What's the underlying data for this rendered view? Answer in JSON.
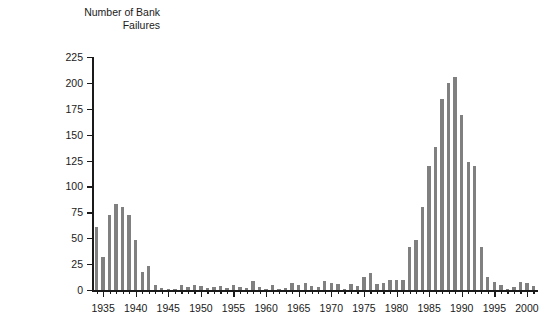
{
  "chart_data": {
    "type": "bar",
    "title": "",
    "ylabel": "Number of Bank\nFailures",
    "xlabel": "",
    "ylim": [
      0,
      225
    ],
    "ytick_values": [
      0,
      25,
      50,
      75,
      100,
      125,
      150,
      175,
      200,
      225
    ],
    "ytick_labels": [
      "0",
      "25",
      "50",
      "75",
      "100",
      "125",
      "150",
      "175",
      "200",
      "225"
    ],
    "xtick_labels": [
      "1935",
      "1940",
      "1945",
      "1950",
      "1955",
      "1960",
      "1965",
      "1970",
      "1975",
      "1980",
      "1985",
      "1990",
      "1995",
      "2000"
    ],
    "xtick_values": [
      1935,
      1940,
      1945,
      1950,
      1955,
      1960,
      1965,
      1970,
      1975,
      1980,
      1985,
      1990,
      1995,
      2000
    ],
    "xlim": [
      1933.3,
      2001.7
    ],
    "grid": false,
    "legend": null,
    "bar_color": "#808080",
    "axis_color": "#1a1a1a",
    "background": "#ffffff",
    "categories": [
      1934,
      1935,
      1936,
      1937,
      1938,
      1939,
      1940,
      1941,
      1942,
      1943,
      1944,
      1945,
      1946,
      1947,
      1948,
      1949,
      1950,
      1951,
      1952,
      1953,
      1954,
      1955,
      1956,
      1957,
      1958,
      1959,
      1960,
      1961,
      1962,
      1963,
      1964,
      1965,
      1966,
      1967,
      1968,
      1969,
      1970,
      1971,
      1972,
      1973,
      1974,
      1975,
      1976,
      1977,
      1978,
      1979,
      1980,
      1981,
      1982,
      1983,
      1984,
      1985,
      1986,
      1987,
      1988,
      1989,
      1990,
      1991,
      1992,
      1993,
      1994,
      1995,
      1996,
      1997,
      1998,
      1999,
      2000,
      2001
    ],
    "values": [
      61,
      32,
      72,
      83,
      80,
      72,
      48,
      17,
      23,
      5,
      2,
      1,
      1,
      5,
      3,
      5,
      4,
      2,
      3,
      4,
      2,
      5,
      3,
      2,
      9,
      3,
      1,
      5,
      1,
      2,
      7,
      5,
      7,
      4,
      3,
      9,
      7,
      6,
      1,
      6,
      4,
      13,
      16,
      6,
      7,
      10,
      10,
      10,
      42,
      48,
      80,
      120,
      138,
      184,
      200,
      206,
      169,
      124,
      120,
      42,
      13,
      8,
      5,
      1,
      3,
      8,
      7,
      4
    ]
  },
  "axis_title_text": "Number of Bank\nFailures"
}
